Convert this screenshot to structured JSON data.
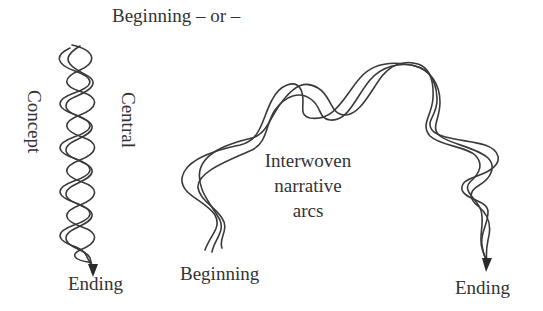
{
  "figure": {
    "top_caption": "Beginning – or –",
    "left_diagram": {
      "label_vertical_left": "Concept",
      "label_vertical_right": "Central",
      "end_label": "Ending",
      "description": "Three tightly braided strands descending vertically, ending in an arrow"
    },
    "right_diagram": {
      "start_label": "Beginning",
      "center_label_lines": [
        "Interwoven",
        "narrative",
        "arcs"
      ],
      "end_label": "Ending",
      "description": "Three loosely interwoven strands arching from beginning to ending, ending in an arrow"
    },
    "colors": {
      "stroke": "#3a3a3a",
      "text": "#333333",
      "background": "#ffffff"
    }
  }
}
